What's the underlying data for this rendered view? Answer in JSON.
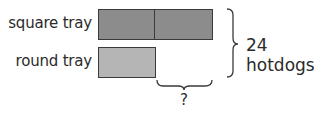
{
  "diagram": {
    "type": "tape-diagram",
    "rows": [
      {
        "label": "square tray",
        "units": 2,
        "color": "#8c8c8c"
      },
      {
        "label": "round tray",
        "units": 1,
        "color": "#b5b5b5"
      }
    ],
    "total_label": "24 hotdogs",
    "difference_label": "?"
  }
}
